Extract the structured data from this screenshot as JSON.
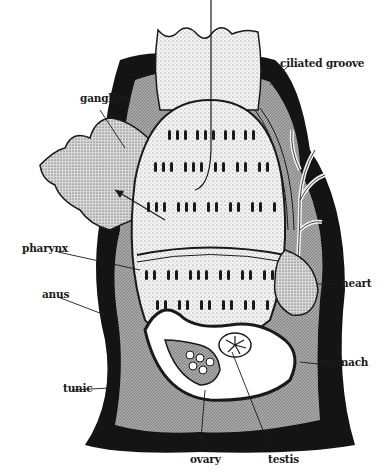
{
  "diagram": {
    "labels": {
      "ganglion": "ganglion",
      "ciliated_groove": "ciliated groove",
      "pharynx": "pharynx",
      "anus": "anus",
      "heart": "heart",
      "stomach": "stomach",
      "tunic": "tunic",
      "ovary": "ovary",
      "testis": "testis"
    },
    "colors": {
      "ink": "#1a1a1a",
      "tunic_fill": "#141414",
      "body_gray": "#9a9a9a",
      "light_stipple": "#ececec",
      "background": "#ffffff"
    }
  }
}
